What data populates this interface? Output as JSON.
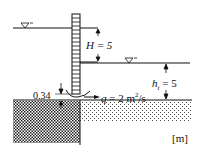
{
  "diagram": {
    "type": "sluice-gate-flow",
    "labels": {
      "upstream_head": "H = 5",
      "tailwater_depth": "h_t = 5",
      "tailwater_symbol": "h",
      "tailwater_sub": "t",
      "tailwater_value": " = 5",
      "opening": "0.34",
      "discharge": "q = 2 m²/s",
      "discharge_q": "q",
      "discharge_value": " = 2 m",
      "discharge_exp": "2",
      "discharge_unit": "/s",
      "units": "[m]"
    },
    "values": {
      "H": 5,
      "h_t": 5,
      "gate_opening": 0.34,
      "q": 2,
      "q_unit": "m²/s",
      "length_unit": "m"
    },
    "symbols": [
      "water-surface-upstream",
      "water-surface-downstream"
    ],
    "colors": {
      "line": "#111111",
      "background": "#ffffff"
    }
  }
}
